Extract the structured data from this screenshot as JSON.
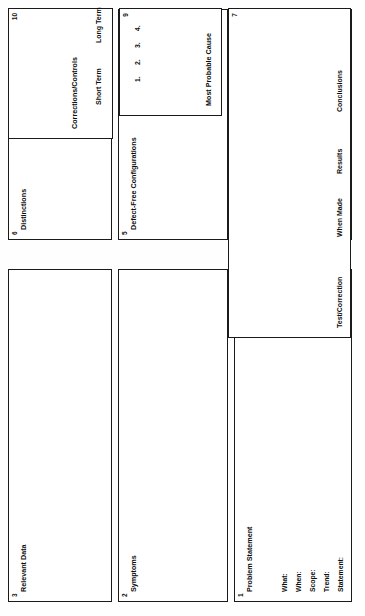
{
  "document": {
    "kind": "problem-solving-worksheet",
    "orientation": "landscape-page-shown-rotated"
  },
  "boxes": [
    {
      "number": "1",
      "title": "Problem Statement",
      "fields": [
        "What:",
        "When:",
        "Scope:",
        "Trend:",
        "Statement:"
      ]
    },
    {
      "number": "2",
      "title": "Symptoms"
    },
    {
      "number": "3",
      "title": "Relevant Data"
    },
    {
      "number": "4",
      "title": "Changes"
    },
    {
      "number": "5",
      "title": "Defect-Free Configurations"
    },
    {
      "number": "6",
      "title": "Distinctions"
    },
    {
      "number": "7",
      "title": "Test/Correction",
      "columns": [
        "Test/Correction",
        "When Made",
        "Results",
        "Conclusions"
      ]
    },
    {
      "number": "9",
      "title": "Most Probable Cause",
      "list": [
        "1.",
        "2.",
        "3.",
        "4."
      ]
    },
    {
      "number": "10",
      "title": "Corrections/Controls",
      "sub_labels": [
        "Short Term",
        "Long Term"
      ]
    }
  ],
  "colors": {
    "ink": "#0d0d0d",
    "border": "#1a1a1a",
    "paper": "#ffffff"
  }
}
